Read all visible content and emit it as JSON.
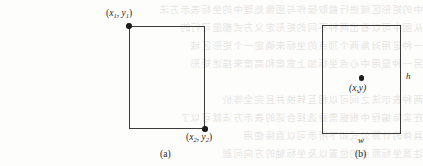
{
  "figure": {
    "background_color": "#fdfdfc",
    "ink_color": "#3b3b3b",
    "ghost_text_color": "#e6e4e2",
    "panels": [
      {
        "id": "a",
        "caption": "(a)",
        "shape": "rectangle",
        "points": [
          {
            "name": "top-left-corner-point",
            "label_parts": {
              "open": "(",
              "var1": "x",
              "sub1": "1",
              "comma": ", ",
              "var2": "y",
              "sub2": "1",
              "close": ")"
            }
          },
          {
            "name": "bottom-right-corner-point",
            "label_parts": {
              "open": "(",
              "var1": "x",
              "sub1": "2",
              "comma": ", ",
              "var2": "y",
              "sub2": "2",
              "close": ")"
            }
          }
        ]
      },
      {
        "id": "b",
        "caption": "(b)",
        "shape": "rectangle",
        "center_point_label": "(x,y)",
        "height_label": "h",
        "width_label": "w"
      }
    ]
  },
  "ghost_lines": [
    "中的矩形区域进行截取操作与图像处理中的坐标表示方法",
    "从图中可以看出两种不同的矩形定义方式都是可行的",
    "一种是用对角两个顶点的坐标来确定一个矩形区域",
    "另一种是用中心点坐标加上宽度和高度来描述矩形",
    "两种表示法之间可以相互转换并且完全等价",
    "在实际编程中根据需要选择合适的表示方法就可以了",
    "具体的计算公式如下所示可以直接使用",
    "注意坐标原点的位置以及坐标轴的方向问题"
  ]
}
